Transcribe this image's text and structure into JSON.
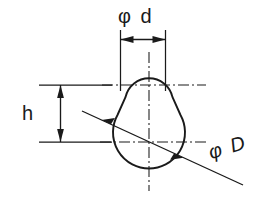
{
  "drawing": {
    "title": "Keyhole profile cross-section dimensioned drawing",
    "background_color": "#ffffff",
    "line_color": "#1a1a1a",
    "dimensions": [
      {
        "id": "phi_d",
        "label": "φ d",
        "symbol": "φ",
        "variable": "d",
        "meaning": "diameter of upper small circle",
        "position": "top",
        "orientation": "horizontal",
        "arrows": "double"
      },
      {
        "id": "h",
        "label": "h",
        "symbol": "",
        "variable": "h",
        "meaning": "vertical distance between upper and lower circle centers",
        "position": "left",
        "orientation": "vertical",
        "arrows": "double"
      },
      {
        "id": "phi_D",
        "label": "φ D",
        "symbol": "φ",
        "variable": "D",
        "meaning": "diameter of lower large circle",
        "position": "bottom-right",
        "orientation": "diagonal",
        "arrows": "double"
      }
    ],
    "geometry": {
      "small_circle": {
        "cx": 149,
        "cy": 85,
        "r": 24
      },
      "large_circle": {
        "cx": 149,
        "cy": 142,
        "r": 36
      },
      "centerlines": [
        {
          "id": "vertical",
          "x": 149,
          "y1": 52,
          "y2": 190
        },
        {
          "id": "horizontal-upper",
          "y": 85,
          "x1": 36,
          "x2": 206
        },
        {
          "id": "horizontal-lower",
          "y": 142,
          "x1": 36,
          "x2": 206
        }
      ]
    }
  }
}
